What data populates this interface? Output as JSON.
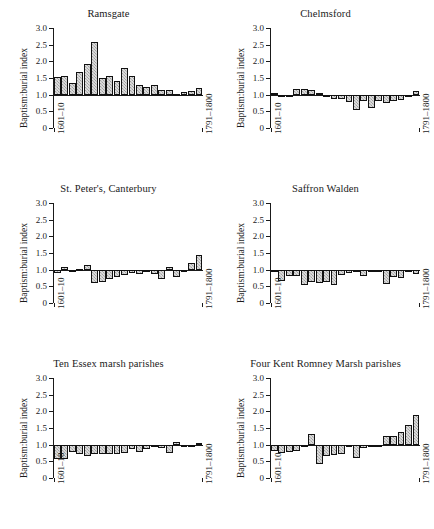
{
  "figure": {
    "panel_count": 6,
    "shared_ylabel": "Baptism:burial index",
    "shared_xlabel_left": "1601–10",
    "shared_xlabel_right": "1791–1800",
    "ytick_labels": [
      "3.0",
      "2.5",
      "2.0",
      "1.5",
      "1.0",
      "0.5",
      "0"
    ],
    "bar_fill": "#b9b9b9",
    "bar_edge": "#111111",
    "background": "#ffffff"
  },
  "chart_data": [
    {
      "type": "bar",
      "title": "Ramsgate",
      "xlabel": "",
      "ylabel": "Baptism:burial index",
      "ylim": [
        0,
        3.0
      ],
      "yticks": [
        0,
        0.5,
        1.0,
        1.5,
        2.0,
        2.5,
        3.0
      ],
      "baseline": 1.0,
      "grid": false,
      "legend": "none",
      "categories": [
        "1601–10",
        "1611–20",
        "1621–30",
        "1631–40",
        "1641–50",
        "1651–60",
        "1661–70",
        "1671–80",
        "1681–90",
        "1691–1700",
        "1701–10",
        "1711–20",
        "1721–30",
        "1731–40",
        "1741–50",
        "1751–60",
        "1761–70",
        "1771–80",
        "1781–90",
        "1791–1800"
      ],
      "values": [
        1.54,
        1.57,
        1.34,
        1.67,
        1.93,
        2.59,
        1.49,
        1.57,
        1.41,
        1.79,
        1.56,
        1.29,
        1.23,
        1.3,
        1.13,
        1.14,
        1.03,
        1.07,
        1.11,
        1.19
      ]
    },
    {
      "type": "bar",
      "title": "Chelmsford",
      "xlabel": "",
      "ylabel": "Baptism:burial index",
      "ylim": [
        0,
        3.0
      ],
      "yticks": [
        0,
        0.5,
        1.0,
        1.5,
        2.0,
        2.5,
        3.0
      ],
      "baseline": 1.0,
      "grid": false,
      "legend": "none",
      "categories": [
        "1601–10",
        "1611–20",
        "1621–30",
        "1631–40",
        "1641–50",
        "1651–60",
        "1661–70",
        "1671–80",
        "1681–90",
        "1691–1700",
        "1701–10",
        "1711–20",
        "1721–30",
        "1731–40",
        "1741–50",
        "1751–60",
        "1761–70",
        "1771–80",
        "1781–90",
        "1791–1800"
      ],
      "values": [
        1.06,
        0.98,
        1.0,
        1.17,
        1.17,
        1.14,
        1.06,
        0.99,
        0.86,
        0.88,
        0.77,
        0.53,
        0.8,
        0.6,
        0.8,
        0.76,
        0.81,
        0.84,
        0.95,
        1.1
      ]
    },
    {
      "type": "bar",
      "title": "St. Peter's, Canterbury",
      "xlabel": "",
      "ylabel": "Baptism:burial index",
      "ylim": [
        0,
        3.0
      ],
      "yticks": [
        0,
        0.5,
        1.0,
        1.5,
        2.0,
        2.5,
        3.0
      ],
      "baseline": 1.0,
      "grid": false,
      "legend": "none",
      "categories": [
        "1601–10",
        "1611–20",
        "1621–30",
        "1631–40",
        "1641–50",
        "1651–60",
        "1661–70",
        "1671–80",
        "1681–90",
        "1691–1700",
        "1701–10",
        "1711–20",
        "1721–30",
        "1731–40",
        "1741–50",
        "1751–60",
        "1761–70",
        "1771–80",
        "1781–90",
        "1791–1800"
      ],
      "values": [
        0.89,
        1.07,
        0.93,
        1.01,
        1.13,
        0.61,
        0.63,
        0.73,
        0.79,
        0.85,
        0.91,
        0.86,
        0.93,
        0.86,
        0.72,
        1.08,
        0.79,
        1.0,
        1.21,
        1.45
      ]
    },
    {
      "type": "bar",
      "title": "Saffron Walden",
      "xlabel": "",
      "ylabel": "Baptism:burial index",
      "ylim": [
        0,
        3.0
      ],
      "yticks": [
        0,
        0.5,
        1.0,
        1.5,
        2.0,
        2.5,
        3.0
      ],
      "baseline": 1.0,
      "grid": false,
      "legend": "none",
      "categories": [
        "1601–10",
        "1611–20",
        "1621–30",
        "1631–40",
        "1641–50",
        "1651–60",
        "1661–70",
        "1671–80",
        "1681–90",
        "1691–1700",
        "1701–10",
        "1711–20",
        "1721–30",
        "1731–40",
        "1741–50",
        "1751–60",
        "1761–70",
        "1771–80",
        "1781–90",
        "1791–1800"
      ],
      "values": [
        0.93,
        0.66,
        0.8,
        0.82,
        0.53,
        0.62,
        0.6,
        0.63,
        0.55,
        0.85,
        0.9,
        1.0,
        0.8,
        0.96,
        0.99,
        0.57,
        0.79,
        0.76,
        0.97,
        0.86
      ]
    },
    {
      "type": "bar",
      "title": "Ten Essex marsh parishes",
      "xlabel": "",
      "ylabel": "Baptism:burial index",
      "ylim": [
        0,
        3.0
      ],
      "yticks": [
        0,
        0.5,
        1.0,
        1.5,
        2.0,
        2.5,
        3.0
      ],
      "baseline": 1.0,
      "grid": false,
      "legend": "none",
      "categories": [
        "1601–10",
        "1611–20",
        "1621–30",
        "1631–40",
        "1641–50",
        "1651–60",
        "1661–70",
        "1671–80",
        "1681–90",
        "1691–1700",
        "1701–10",
        "1711–20",
        "1721–30",
        "1731–40",
        "1741–50",
        "1751–60",
        "1761–70",
        "1771–80",
        "1781–90",
        "1791–1800"
      ],
      "values": [
        0.57,
        0.57,
        0.78,
        0.72,
        0.65,
        0.73,
        0.73,
        0.73,
        0.71,
        0.76,
        0.88,
        0.78,
        0.88,
        0.92,
        0.9,
        0.74,
        1.07,
        0.93,
        0.93,
        1.06
      ]
    },
    {
      "type": "bar",
      "title": "Four Kent Romney Marsh parishes",
      "xlabel": "",
      "ylabel": "Baptism:burial index",
      "ylim": [
        0,
        3.0
      ],
      "yticks": [
        0,
        0.5,
        1.0,
        1.5,
        2.0,
        2.5,
        3.0
      ],
      "baseline": 1.0,
      "grid": false,
      "legend": "none",
      "categories": [
        "1601–10",
        "1611–20",
        "1621–30",
        "1631–40",
        "1641–50",
        "1651–60",
        "1661–70",
        "1671–80",
        "1681–90",
        "1691–1700",
        "1701–10",
        "1711–20",
        "1721–30",
        "1731–40",
        "1741–50",
        "1751–60",
        "1761–70",
        "1771–80",
        "1781–90",
        "1791–1800"
      ],
      "values": [
        0.8,
        0.76,
        0.79,
        0.8,
        0.93,
        1.31,
        0.42,
        0.66,
        0.7,
        0.72,
        1.0,
        0.6,
        0.9,
        0.95,
        1.0,
        1.26,
        1.27,
        1.37,
        1.6,
        1.89
      ]
    }
  ]
}
